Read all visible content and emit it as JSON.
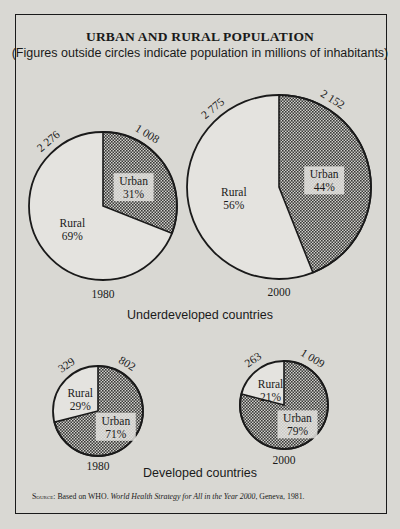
{
  "title": "URBAN AND RURAL POPULATION",
  "subtitle": "(Figures outside circles indicate population in millions of inhabitants)",
  "groups": {
    "underdeveloped": "Underdeveloped countries",
    "developed": "Developed countries"
  },
  "source": {
    "prefix": "Source:",
    "text": "Based on WHO.",
    "title": "World Health Strategy for All in the Year 2000",
    "suffix": ", Geneva, 1981."
  },
  "colors": {
    "background": "#d9d8d3",
    "ink": "#1a1a1a",
    "urban_fill": "#8a8a86"
  },
  "chart_data": [
    {
      "type": "pie",
      "group": "Underdeveloped countries",
      "year": "1980",
      "slices": [
        {
          "label": "Urban",
          "percent": 31,
          "value": 1008,
          "value_label": "1 008",
          "pattern": "dotted"
        },
        {
          "label": "Rural",
          "percent": 69,
          "value": 2276,
          "value_label": "2 276",
          "pattern": "plain"
        }
      ]
    },
    {
      "type": "pie",
      "group": "Underdeveloped countries",
      "year": "2000",
      "slices": [
        {
          "label": "Urban",
          "percent": 44,
          "value": 2152,
          "value_label": "2 152",
          "pattern": "dotted"
        },
        {
          "label": "Rural",
          "percent": 56,
          "value": 2775,
          "value_label": "2 775",
          "pattern": "plain"
        }
      ]
    },
    {
      "type": "pie",
      "group": "Developed countries",
      "year": "1980",
      "slices": [
        {
          "label": "Urban",
          "percent": 71,
          "value": 802,
          "value_label": "802",
          "pattern": "dotted"
        },
        {
          "label": "Rural",
          "percent": 29,
          "value": 329,
          "value_label": "329",
          "pattern": "plain"
        }
      ]
    },
    {
      "type": "pie",
      "group": "Developed countries",
      "year": "2000",
      "slices": [
        {
          "label": "Urban",
          "percent": 79,
          "value": 1009,
          "value_label": "1 009",
          "pattern": "dotted"
        },
        {
          "label": "Rural",
          "percent": 21,
          "value": 263,
          "value_label": "263",
          "pattern": "plain"
        }
      ]
    }
  ]
}
